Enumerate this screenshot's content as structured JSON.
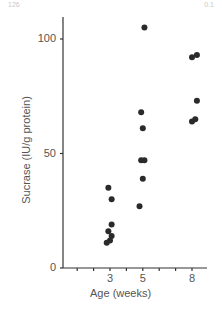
{
  "page": {
    "corner_left": "126",
    "corner_right": "0.1"
  },
  "chart_data": {
    "type": "scatter",
    "title": "",
    "xlabel": "Age (weeks)",
    "ylabel": "Sucrase (IU/g protein)",
    "x_ticks": [
      3,
      5,
      8
    ],
    "y_ticks": [
      0,
      50,
      100
    ],
    "xlim": [
      1,
      8.9
    ],
    "ylim": [
      0,
      110
    ],
    "grid": false,
    "legend": null,
    "points": [
      {
        "x": 2.9,
        "y": 35
      },
      {
        "x": 3.1,
        "y": 30
      },
      {
        "x": 3.1,
        "y": 19
      },
      {
        "x": 2.9,
        "y": 16
      },
      {
        "x": 3.1,
        "y": 14
      },
      {
        "x": 3.0,
        "y": 12
      },
      {
        "x": 2.8,
        "y": 11
      },
      {
        "x": 5.1,
        "y": 105
      },
      {
        "x": 4.9,
        "y": 68
      },
      {
        "x": 5.0,
        "y": 61
      },
      {
        "x": 4.9,
        "y": 47
      },
      {
        "x": 5.1,
        "y": 47
      },
      {
        "x": 5.0,
        "y": 39
      },
      {
        "x": 4.8,
        "y": 27
      },
      {
        "x": 8.0,
        "y": 92
      },
      {
        "x": 8.3,
        "y": 93
      },
      {
        "x": 8.3,
        "y": 73
      },
      {
        "x": 8.0,
        "y": 64
      },
      {
        "x": 8.2,
        "y": 65
      }
    ]
  }
}
